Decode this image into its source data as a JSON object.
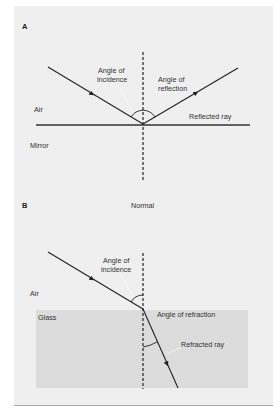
{
  "panel_a": {
    "label": "A",
    "angle_of_incidence": [
      "Angle of",
      "incidence"
    ],
    "angle_of_reflection": [
      "Angle of",
      "reflection"
    ],
    "medium_top": "Air",
    "medium_bottom": "Mirror",
    "reflected_ray": "Reflected ray"
  },
  "panel_b": {
    "label": "B",
    "normal": "Normal",
    "angle_of_incidence": [
      "Angle of",
      "incidence"
    ],
    "medium_top": "Air",
    "medium_bottom": "Glass",
    "angle_of_refraction": "Angle of refraction",
    "refracted_ray": "Refracted ray"
  },
  "colors": {
    "panel_bg": "#efefef",
    "glass": "#dcdcdc",
    "line": "#222222"
  }
}
